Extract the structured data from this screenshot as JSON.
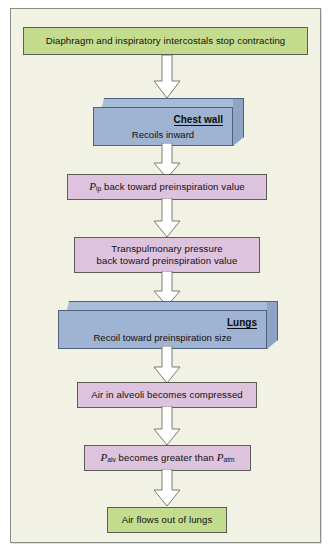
{
  "figure": {
    "background_color": "#f2f2e4",
    "frame_color": "#8c8c86"
  },
  "palette": {
    "green_fill": "#c4dc8e",
    "purple_fill": "#ddc3dd",
    "blue_front": "#9fb4d2",
    "blue_top": "#a8bcd8",
    "blue_side": "#8ea4c4",
    "box_stroke": "#5d5d57",
    "arrow_fill": "#ffffff",
    "arrow_stroke": "#7a7a74"
  },
  "steps": {
    "step1": {
      "label": "Diaphragm and inspiratory intercostals stop contracting",
      "type": "green-box"
    },
    "step2": {
      "title": "Chest wall",
      "body": "Recoils inward",
      "type": "prism"
    },
    "step3": {
      "symbol": "P",
      "subscript": "ip",
      "text": " back toward preinspiration value",
      "type": "purple-box"
    },
    "step4": {
      "line1": "Transpulmonary pressure",
      "line2": "back toward preinspiration value",
      "type": "purple-box"
    },
    "step5": {
      "title": "Lungs",
      "body": "Recoil toward preinspiration size",
      "type": "prism"
    },
    "step6": {
      "label": "Air in alveoli becomes compressed",
      "type": "purple-box"
    },
    "step7": {
      "symbol1": "P",
      "subscript1": "alv",
      "middle": " becomes greater than ",
      "symbol2": "P",
      "subscript2": "atm",
      "type": "purple-box"
    },
    "step8": {
      "label": "Air flows out of lungs",
      "type": "green-box"
    }
  },
  "arrows": {
    "a1": "down-block-arrow",
    "a2": "down-block-arrow",
    "a3": "down-block-arrow",
    "a4": "down-block-arrow",
    "a5": "down-block-arrow",
    "a6": "down-block-arrow",
    "a7": "down-block-arrow"
  }
}
